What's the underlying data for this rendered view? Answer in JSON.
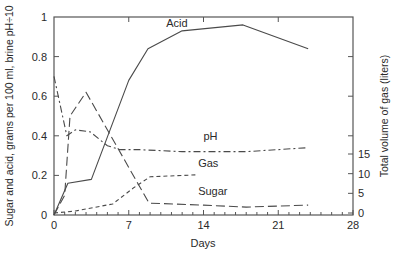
{
  "chart_data": {
    "type": "line",
    "title": "",
    "xlabel": "Days",
    "ylabel": "Sugar and acid, grams per 100 ml, brine pH÷10",
    "y2label": "Total volume of gas (liters)",
    "xlim": [
      0,
      28
    ],
    "ylim": [
      0,
      1
    ],
    "y2lim": [
      0,
      15
    ],
    "x_ticks": [
      0,
      7,
      14,
      21,
      28
    ],
    "y_ticks": [
      0,
      0.2,
      0.4,
      0.6,
      0.8,
      1
    ],
    "y_tick_labels": [
      "0",
      "0.2",
      "0.4",
      "0.6",
      "0.8",
      "1"
    ],
    "y2_ticks": [
      0,
      5,
      10,
      15
    ],
    "grid": false,
    "legend": "inline labels",
    "series": [
      {
        "name": "Acid",
        "style": "solid",
        "axis": "left",
        "x": [
          0,
          1.3,
          3.5,
          7,
          8.8,
          12,
          17.7,
          23.8
        ],
        "y": [
          0,
          0.16,
          0.18,
          0.68,
          0.84,
          0.93,
          0.96,
          0.84
        ]
      },
      {
        "name": "pH",
        "style": "dash-dot",
        "axis": "left",
        "x": [
          0,
          1.2,
          2,
          3.4,
          4.3,
          5,
          6.2,
          8,
          12,
          18,
          23.8
        ],
        "y": [
          0.7,
          0.4,
          0.43,
          0.42,
          0.38,
          0.35,
          0.33,
          0.33,
          0.32,
          0.32,
          0.34
        ]
      },
      {
        "name": "Gas",
        "style": "short-dash",
        "axis": "right",
        "x": [
          0,
          2,
          5.5,
          7.5,
          9,
          13.3
        ],
        "y": [
          0,
          0.5,
          2.3,
          6.5,
          9.2,
          9.7
        ]
      },
      {
        "name": "Sugar",
        "style": "long-dash",
        "axis": "left",
        "x": [
          0,
          1,
          1.5,
          3,
          8.9,
          14,
          18,
          23.8
        ],
        "y": [
          0,
          0.1,
          0.5,
          0.62,
          0.06,
          0.05,
          0.04,
          0.05
        ]
      }
    ],
    "annotations": [
      {
        "text": "Acid",
        "x": 10.5,
        "y": 0.95
      },
      {
        "text": "pH",
        "x": 14,
        "y": 0.38
      },
      {
        "text": "Gas",
        "x": 13.5,
        "y": 0.24
      },
      {
        "text": "Sugar",
        "x": 13.5,
        "y": 0.1
      }
    ]
  }
}
